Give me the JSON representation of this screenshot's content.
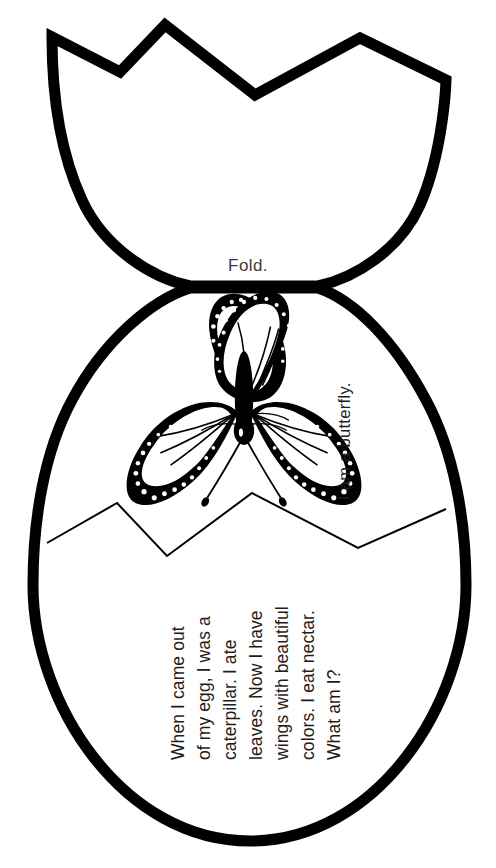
{
  "document": {
    "title": "Butterfly Egg Fold Craft",
    "type": "printable-worksheet",
    "background_color": "#ffffff",
    "ink_color": "#000000",
    "text_color": "#1d1d1d"
  },
  "fold": {
    "label": "Fold."
  },
  "answer": {
    "text": "I am a butterfly.",
    "orientation": "rotated-90-ccw"
  },
  "riddle": {
    "orientation": "rotated-90-ccw",
    "lines": [
      "When I came out",
      "of my egg, I was a",
      "caterpillar. I ate",
      "leaves. Now I have",
      "wings with beautiful",
      "colors. I eat nectar.",
      "What am I?"
    ],
    "full_text": "When I came out of my egg, I was a caterpillar. I ate leaves. Now I have wings with beautiful colors. I eat nectar. What am I?"
  },
  "illustration": {
    "name": "monarch-butterfly",
    "description": "black and white monarch butterfly line art"
  },
  "shapes": {
    "top_shell": "cracked-eggshell-top",
    "bottom_shell": "egg-body-with-zigzag-crack"
  }
}
